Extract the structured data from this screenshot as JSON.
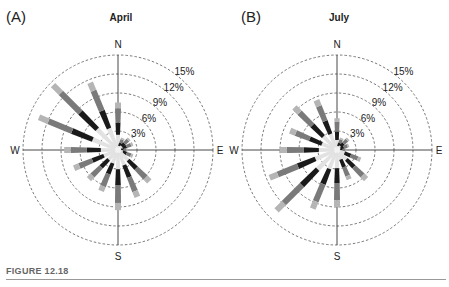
{
  "figure": {
    "caption": "FIGURE 12.18"
  },
  "panels": [
    {
      "label": "(A)",
      "title": "April"
    },
    {
      "label": "(B)",
      "title": "July"
    }
  ],
  "chart_data": [
    {
      "type": "wind-rose",
      "title": "April",
      "panel": "(A)",
      "directions": [
        "N",
        "NNE",
        "NE",
        "ENE",
        "E",
        "ESE",
        "SE",
        "SSE",
        "S",
        "SSW",
        "SW",
        "WSW",
        "W",
        "WNW",
        "NW",
        "NNW"
      ],
      "values": [
        7.5,
        2,
        2.5,
        2.5,
        1.5,
        2.5,
        7,
        8,
        9.5,
        7,
        6.5,
        7.5,
        8.5,
        13.5,
        14.5,
        11.5
      ],
      "unit": "%",
      "rings": [
        3,
        6,
        9,
        12,
        15
      ],
      "ring_labels": [
        "3%",
        "6%",
        "9%",
        "12%",
        "15%"
      ],
      "compass_labels": [
        "N",
        "E",
        "S",
        "W"
      ],
      "segments": [
        "light gray (inner)",
        "black",
        "medium gray",
        "light gray (tip)"
      ]
    },
    {
      "type": "wind-rose",
      "title": "July",
      "panel": "(B)",
      "directions": [
        "N",
        "NNE",
        "NE",
        "ENE",
        "E",
        "ESE",
        "SE",
        "SSE",
        "S",
        "SSW",
        "SW",
        "WSW",
        "W",
        "WNW",
        "NW",
        "NNW"
      ],
      "values": [
        5,
        2,
        2.5,
        2,
        1.5,
        4,
        6.5,
        5,
        9,
        10,
        13.5,
        11.5,
        9,
        8,
        9.5,
        8.5
      ],
      "unit": "%",
      "rings": [
        3,
        6,
        9,
        12,
        15
      ],
      "ring_labels": [
        "3%",
        "6%",
        "9%",
        "12%",
        "15%"
      ],
      "compass_labels": [
        "N",
        "E",
        "S",
        "W"
      ],
      "segments": [
        "light gray (inner)",
        "black",
        "medium gray",
        "light gray (tip)"
      ]
    }
  ],
  "layout": {
    "centers": [
      [
        118,
        150
      ],
      [
        337,
        150
      ]
    ],
    "radius_px": 95,
    "colors": {
      "inner": "#e2e2e2",
      "black": "#1a1a1a",
      "mid": "#7a7a7a",
      "tip": "#b5b5b5",
      "ring": "#555555",
      "axis": "#333333"
    }
  }
}
